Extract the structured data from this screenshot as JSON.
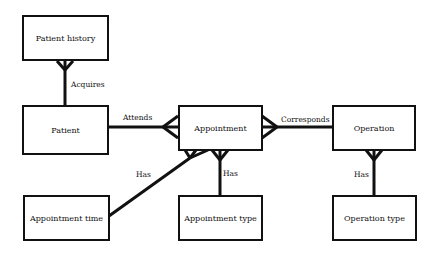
{
  "diagram": {
    "type": "entity-relationship",
    "notation": "crow's foot",
    "entities": [
      {
        "id": "patient_history",
        "label": "Patient history"
      },
      {
        "id": "patient",
        "label": "Patient"
      },
      {
        "id": "appointment",
        "label": "Appointment"
      },
      {
        "id": "operation",
        "label": "Operation"
      },
      {
        "id": "appointment_time",
        "label": "Appointment time"
      },
      {
        "id": "appointment_type",
        "label": "Appointment type"
      },
      {
        "id": "operation_type",
        "label": "Operation type"
      }
    ],
    "relationships": [
      {
        "from": "patient",
        "to": "patient_history",
        "label": "Acquires",
        "many_end": "patient_history"
      },
      {
        "from": "patient",
        "to": "appointment",
        "label": "Attends",
        "many_end": "appointment"
      },
      {
        "from": "appointment",
        "to": "operation",
        "label": "Corresponds",
        "many_end": "appointment"
      },
      {
        "from": "appointment_time",
        "to": "appointment",
        "label": "Has",
        "many_end": "appointment"
      },
      {
        "from": "appointment_type",
        "to": "appointment",
        "label": "Has",
        "many_end": "appointment"
      },
      {
        "from": "operation_type",
        "to": "operation",
        "label": "Has",
        "many_end": "operation"
      }
    ]
  }
}
